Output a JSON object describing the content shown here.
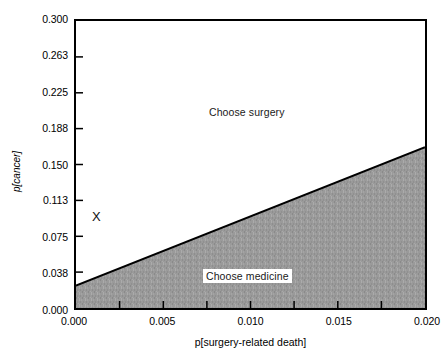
{
  "chart_data": {
    "type": "area",
    "title": "",
    "xlabel": "p[surgery-related death]",
    "ylabel": "p[cancer]",
    "xlim": [
      0.0,
      0.02
    ],
    "ylim": [
      0.0,
      0.3
    ],
    "grid": false,
    "legend": "none",
    "x_ticks": [
      {
        "value": 0.0,
        "label": "0.000",
        "labeled": true
      },
      {
        "value": 0.0025,
        "label": "",
        "labeled": false
      },
      {
        "value": 0.005,
        "label": "0.005",
        "labeled": true
      },
      {
        "value": 0.0075,
        "label": "",
        "labeled": false
      },
      {
        "value": 0.01,
        "label": "0.010",
        "labeled": true
      },
      {
        "value": 0.0125,
        "label": "",
        "labeled": false
      },
      {
        "value": 0.015,
        "label": "0.015",
        "labeled": true
      },
      {
        "value": 0.0175,
        "label": "",
        "labeled": false
      },
      {
        "value": 0.02,
        "label": "0.020",
        "labeled": true
      }
    ],
    "y_ticks": [
      {
        "value": 0.0,
        "label": "0.000"
      },
      {
        "value": 0.038,
        "label": "0.038"
      },
      {
        "value": 0.075,
        "label": "0.075"
      },
      {
        "value": 0.113,
        "label": "0.113"
      },
      {
        "value": 0.15,
        "label": "0.150"
      },
      {
        "value": 0.188,
        "label": "0.188"
      },
      {
        "value": 0.225,
        "label": "0.225"
      },
      {
        "value": 0.263,
        "label": "0.263"
      },
      {
        "value": 0.3,
        "label": "0.300"
      }
    ],
    "threshold_line": {
      "name": "decision-threshold",
      "x": [
        0.0,
        0.02
      ],
      "y": [
        0.0235,
        0.168
      ],
      "color": "#000000",
      "width": 2
    },
    "regions": [
      {
        "name": "choose-surgery",
        "label": "Choose surgery",
        "fill": "#ffffff",
        "position": "above-threshold",
        "label_x": 0.0093,
        "label_y": 0.2115
      },
      {
        "name": "choose-medicine",
        "label": "Choose medicine",
        "fill": "#9a9a9a",
        "position": "below-threshold",
        "label_x": 0.0093,
        "label_y": 0.0435
      }
    ],
    "annotations": [
      {
        "name": "patient-point",
        "label": "X",
        "x": 0.0013,
        "y": 0.0975
      }
    ],
    "colors": {
      "axis": "#000000",
      "shaded_region": "#9a9a9a",
      "background": "#ffffff",
      "text": "#000000"
    }
  }
}
